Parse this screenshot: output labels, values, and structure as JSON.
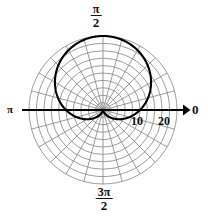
{
  "figure": {
    "name": "polar-cardioid-plot",
    "background_color": "#ffffff",
    "grid_color": "#8a8a8a",
    "curve_color": "#000000",
    "axis_color": "#000000"
  },
  "angle_labels": {
    "right": "0",
    "left": "π",
    "top_numerator": "π",
    "top_denominator": "2",
    "bottom_numerator": "3π",
    "bottom_denominator": "2"
  },
  "radial_ticks": {
    "labels": [
      "10",
      "20"
    ],
    "values": [
      10,
      20
    ]
  },
  "chart_data": {
    "type": "line",
    "plot_kind": "polar",
    "title": "",
    "xlabel": "",
    "ylabel": "",
    "equation": "r = 10(1 - sin(θ))",
    "curve_name": "cardioid",
    "orientation": "cusp at pole pointing toward 3π/2, lobe opening toward π/2",
    "theta_unit": "radians",
    "rlim": [
      0,
      20
    ],
    "r_gridlines": [
      2,
      4,
      6,
      8,
      10,
      12,
      14,
      16,
      18,
      20
    ],
    "theta_gridlines_deg": [
      0,
      15,
      30,
      45,
      60,
      75,
      90,
      105,
      120,
      135,
      150,
      165,
      180,
      195,
      210,
      225,
      240,
      255,
      270,
      285,
      300,
      315,
      330,
      345
    ],
    "grid": true,
    "legend": "none",
    "angle_tick_labels": [
      "0",
      "π/2",
      "π",
      "3π/2"
    ],
    "radial_tick_labels": [
      "10",
      "20"
    ],
    "series": [
      {
        "name": "cardioid",
        "theta_deg": [
          0,
          10,
          20,
          30,
          40,
          50,
          60,
          70,
          80,
          90,
          100,
          110,
          120,
          130,
          140,
          150,
          160,
          170,
          180,
          190,
          200,
          210,
          220,
          230,
          240,
          250,
          260,
          270,
          280,
          290,
          300,
          310,
          320,
          330,
          340,
          350,
          360
        ],
        "r": [
          10.0,
          11.74,
          13.42,
          15.0,
          16.43,
          17.66,
          18.66,
          19.4,
          19.85,
          20.0,
          19.85,
          19.4,
          18.66,
          17.66,
          16.43,
          15.0,
          13.42,
          11.74,
          10.0,
          8.26,
          6.58,
          5.0,
          3.57,
          2.34,
          1.34,
          0.6,
          0.15,
          0.0,
          0.15,
          0.6,
          1.34,
          2.34,
          3.57,
          5.0,
          6.58,
          8.26,
          10.0
        ]
      }
    ]
  }
}
